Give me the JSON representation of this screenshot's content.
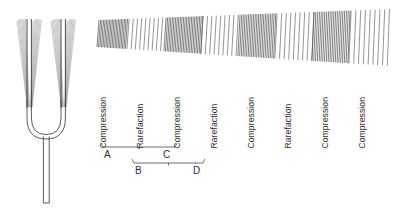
{
  "figure": {
    "background_color": "#ffffff",
    "ink_color": "#2e2e2e"
  },
  "fork": {
    "name": "tuning-fork",
    "description": "Vibrating tuning fork with two tines shown in motion blur",
    "tines": [
      {
        "id": "left-tine",
        "center_x": 29,
        "top_y": 19,
        "bottom_y": 108,
        "blur_halfwidth_top": 13,
        "blur_halfwidth_bottom": 2
      },
      {
        "id": "right-tine",
        "center_x": 63,
        "top_y": 19,
        "bottom_y": 108,
        "blur_halfwidth_top": 13,
        "blur_halfwidth_bottom": 2
      }
    ],
    "handle": {
      "x": 46,
      "top_y": 136,
      "bottom_y": 203,
      "width": 6
    },
    "base_curve_y": 108
  },
  "wave": {
    "name": "sound-wave-band",
    "x_start": 98,
    "x_end": 392,
    "top_left_y": 20,
    "bottom_left_y": 47,
    "top_right_y": 9,
    "bottom_right_y": 66,
    "band_count": 8,
    "bands": [
      {
        "index": 0,
        "type": "compression",
        "x_start": 98,
        "x_end": 128,
        "line_spacing": 1.5
      },
      {
        "index": 1,
        "type": "rarefaction",
        "x_start": 128,
        "x_end": 165,
        "line_spacing": 4.2
      },
      {
        "index": 2,
        "type": "compression",
        "x_start": 165,
        "x_end": 202,
        "line_spacing": 1.6
      },
      {
        "index": 3,
        "type": "rarefaction",
        "x_start": 202,
        "x_end": 239,
        "line_spacing": 4.4
      },
      {
        "index": 4,
        "type": "compression",
        "x_start": 239,
        "x_end": 276,
        "line_spacing": 1.7
      },
      {
        "index": 5,
        "type": "rarefaction",
        "x_start": 276,
        "x_end": 313,
        "line_spacing": 4.6
      },
      {
        "index": 6,
        "type": "compression",
        "x_start": 313,
        "x_end": 350,
        "line_spacing": 1.8
      },
      {
        "index": 7,
        "type": "rarefaction",
        "x_start": 350,
        "x_end": 392,
        "line_spacing": 4.8
      }
    ]
  },
  "labels": [
    {
      "id": "label-1",
      "text": "Compression",
      "x": 108,
      "baseline_y": 140
    },
    {
      "id": "label-2",
      "text": "Rarefaction",
      "x": 145,
      "baseline_y": 140
    },
    {
      "id": "label-3",
      "text": "Compression",
      "x": 182,
      "baseline_y": 140
    },
    {
      "id": "label-4",
      "text": "Rarefaction",
      "x": 219,
      "baseline_y": 140
    },
    {
      "id": "label-5",
      "text": "Compression",
      "x": 256,
      "baseline_y": 140
    },
    {
      "id": "label-6",
      "text": "Rarefaction",
      "x": 293,
      "baseline_y": 140
    },
    {
      "id": "label-7",
      "text": "Compression",
      "x": 330,
      "baseline_y": 140
    },
    {
      "id": "label-8",
      "text": "Compression",
      "x": 367,
      "baseline_y": 140
    }
  ],
  "brackets": {
    "description": "Two wavelength spans marked beneath the wave labels",
    "upper": {
      "id": "bracket-upper",
      "x_start": 101,
      "x_end": 177,
      "y": 147,
      "tick_height": 4,
      "left_letter": {
        "text": "A",
        "x": 104,
        "y": 150
      },
      "right_letter": {
        "text": "C",
        "x": 163,
        "y": 150
      }
    },
    "lower": {
      "id": "bracket-lower",
      "x_start": 132,
      "x_end": 205,
      "y": 163,
      "tick_height": 4,
      "left_letter": {
        "text": "B",
        "x": 135,
        "y": 166
      },
      "right_letter": {
        "text": "D",
        "x": 193,
        "y": 166
      }
    }
  }
}
